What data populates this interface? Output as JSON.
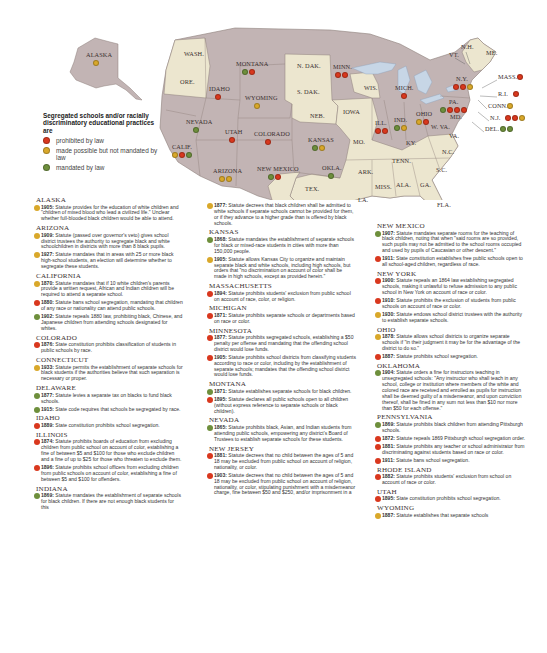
{
  "colors": {
    "prohibited": "#d9381e",
    "made_possible": "#d9a82a",
    "mandated": "#6e8f3c",
    "state_highlight": "#c2b4b4",
    "state_plain": "#ece6cf",
    "water": "#c7d6e6",
    "border": "#8d7f7a"
  },
  "legend": {
    "title": "Segregated schools and/or racially discriminatory educational practices are",
    "items": [
      {
        "key": "prohibited",
        "label": "prohibited by law"
      },
      {
        "key": "made_possible",
        "label": "made possible but not mandated by law"
      },
      {
        "key": "mandated",
        "label": "mandated by law"
      }
    ]
  },
  "map_labels": [
    {
      "name": "ALASKA",
      "x": 86,
      "y": 55,
      "dots": [
        "made_possible"
      ]
    },
    {
      "name": "WASH.",
      "x": 184,
      "y": 54,
      "dots": []
    },
    {
      "name": "ORE.",
      "x": 180,
      "y": 82,
      "dots": []
    },
    {
      "name": "MONTANA",
      "x": 236,
      "y": 64,
      "dots": [
        "mandated",
        "prohibited"
      ]
    },
    {
      "name": "IDAHO",
      "x": 209,
      "y": 89,
      "dots": [
        "prohibited"
      ]
    },
    {
      "name": "WYOMING",
      "x": 245,
      "y": 98,
      "dots": [
        "made_possible"
      ]
    },
    {
      "name": "NEVADA",
      "x": 186,
      "y": 122,
      "dots": [
        "mandated"
      ]
    },
    {
      "name": "UTAH",
      "x": 225,
      "y": 132,
      "dots": [
        "prohibited"
      ]
    },
    {
      "name": "COLORADO",
      "x": 254,
      "y": 134,
      "dots": [
        "prohibited"
      ]
    },
    {
      "name": "CALIF.",
      "x": 172,
      "y": 147,
      "dots": [
        "made_possible",
        "prohibited",
        "mandated"
      ]
    },
    {
      "name": "ARIZONA",
      "x": 213,
      "y": 171,
      "dots": [
        "made_possible",
        "made_possible"
      ]
    },
    {
      "name": "NEW MEXICO",
      "x": 257,
      "y": 169,
      "dots": [
        "mandated",
        "prohibited"
      ]
    },
    {
      "name": "N. DAK.",
      "x": 297,
      "y": 66,
      "dots": []
    },
    {
      "name": "S. DAK.",
      "x": 297,
      "y": 92,
      "dots": []
    },
    {
      "name": "NEB.",
      "x": 310,
      "y": 116,
      "dots": []
    },
    {
      "name": "KANSAS",
      "x": 308,
      "y": 140,
      "dots": [
        "mandated",
        "made_possible"
      ]
    },
    {
      "name": "OKLA.",
      "x": 322,
      "y": 168,
      "dots": [
        "mandated"
      ]
    },
    {
      "name": "TEX.",
      "x": 305,
      "y": 189,
      "dots": []
    },
    {
      "name": "MINN.",
      "x": 333,
      "y": 67,
      "dots": [
        "prohibited",
        "prohibited"
      ]
    },
    {
      "name": "IOWA",
      "x": 343,
      "y": 112,
      "dots": []
    },
    {
      "name": "MO.",
      "x": 353,
      "y": 142,
      "dots": []
    },
    {
      "name": "ARK.",
      "x": 358,
      "y": 172,
      "dots": []
    },
    {
      "name": "WIS.",
      "x": 364,
      "y": 88,
      "dots": []
    },
    {
      "name": "ILL.",
      "x": 375,
      "y": 123,
      "dots": [
        "prohibited",
        "prohibited"
      ]
    },
    {
      "name": "MICH.",
      "x": 395,
      "y": 88,
      "dots": [
        "prohibited"
      ]
    },
    {
      "name": "IND.",
      "x": 394,
      "y": 120,
      "dots": [
        "mandated",
        "made_possible"
      ]
    },
    {
      "name": "OHIO",
      "x": 416,
      "y": 114,
      "dots": [
        "made_possible",
        "prohibited"
      ]
    },
    {
      "name": "KY.",
      "x": 406,
      "y": 143,
      "dots": []
    },
    {
      "name": "TENN.",
      "x": 392,
      "y": 161,
      "dots": []
    },
    {
      "name": "MISS.",
      "x": 375,
      "y": 187,
      "dots": []
    },
    {
      "name": "ALA.",
      "x": 396,
      "y": 185,
      "dots": []
    },
    {
      "name": "GA.",
      "x": 420,
      "y": 185,
      "dots": []
    },
    {
      "name": "LA.",
      "x": 358,
      "y": 200,
      "dots": []
    },
    {
      "name": "FLA.",
      "x": 437,
      "y": 205,
      "dots": []
    },
    {
      "name": "W. VA.",
      "x": 431,
      "y": 127,
      "dots": []
    },
    {
      "name": "VA.",
      "x": 449,
      "y": 136,
      "dots": []
    },
    {
      "name": "N.C.",
      "x": 442,
      "y": 152,
      "dots": []
    },
    {
      "name": "S.C.",
      "x": 436,
      "y": 170,
      "dots": []
    },
    {
      "name": "PA.",
      "x": 449,
      "y": 102,
      "dots": [
        "mandated",
        "prohibited",
        "prohibited",
        "prohibited"
      ]
    },
    {
      "name": "MD.",
      "x": 450,
      "y": 117,
      "dots": []
    },
    {
      "name": "N.Y.",
      "x": 456,
      "y": 79,
      "dots": [
        "prohibited",
        "prohibited",
        "made_possible"
      ]
    },
    {
      "name": "VT.",
      "x": 449,
      "y": 55,
      "dots": []
    },
    {
      "name": "N.H.",
      "x": 461,
      "y": 47,
      "dots": []
    },
    {
      "name": "ME.",
      "x": 486,
      "y": 53,
      "dots": []
    },
    {
      "name": "MASS.",
      "x": 498,
      "y": 77,
      "dots": [
        "prohibited"
      ]
    },
    {
      "name": "R.I.",
      "x": 498,
      "y": 94,
      "dots": [
        "prohibited"
      ]
    },
    {
      "name": "CONN.",
      "x": 488,
      "y": 106,
      "dots": [
        "made_possible"
      ]
    },
    {
      "name": "N.J.",
      "x": 490,
      "y": 118,
      "dots": [
        "prohibited",
        "prohibited",
        "made_possible"
      ]
    },
    {
      "name": "DEL.",
      "x": 485,
      "y": 129,
      "dots": [
        "mandated",
        "mandated"
      ]
    }
  ],
  "columns": [
    [
      {
        "state": "ALASKA",
        "entries": [
          {
            "type": "made_possible",
            "year": "1905:",
            "text": " Statute provides for the education of white children and \"children of mixed blood who lead a civilized life.\" Unclear whether full-blooded black children would be able to attend."
          }
        ]
      },
      {
        "state": "ARIZONA",
        "entries": [
          {
            "type": "made_possible",
            "year": "1909:",
            "text": " Statute (passed over governor's veto) gives school district trustees the authority to segregate black and white schoolchildren in districts with more than 8 black pupils."
          },
          {
            "type": "made_possible",
            "year": "1927:",
            "text": " Statute mandates that in areas with 25 or more black high-school students, an election will determine whether to segregate these students."
          }
        ]
      },
      {
        "state": "CALIFORNIA",
        "entries": [
          {
            "type": "made_possible",
            "year": "1870:",
            "text": " Statute mandates that if 10 white children's parents provide a written request, African and Indian children will be required to attend a separate school."
          },
          {
            "type": "prohibited",
            "year": "1880:",
            "text": " Statute bans school segregation, mandating that children of any race or nationality can attend public schools."
          },
          {
            "type": "mandated",
            "year": "1902:",
            "text": " Statute repeals 1880 law, prohibiting black, Chinese, and Japanese children from attending schools designated for whites."
          }
        ]
      },
      {
        "state": "COLORADO",
        "entries": [
          {
            "type": "prohibited",
            "year": "1876:",
            "text": " State constitution prohibits classification of students in public schools by race."
          }
        ]
      },
      {
        "state": "CONNECTICUT",
        "entries": [
          {
            "type": "made_possible",
            "year": "1933:",
            "text": " Statute permits the establishment of separate schools for black students if the authorities believe that such separation is necessary or proper."
          }
        ]
      },
      {
        "state": "DELAWARE",
        "entries": [
          {
            "type": "mandated",
            "year": "1877:",
            "text": " Statute levies a separate tax on blacks to fund black schools."
          },
          {
            "type": "mandated",
            "year": "1915:",
            "text": " State code requires that schools be segregated by race."
          }
        ]
      },
      {
        "state": "IDAHO",
        "entries": [
          {
            "type": "prohibited",
            "year": "1889:",
            "text": " State constitution prohibits school segregation."
          }
        ]
      },
      {
        "state": "ILLINOIS",
        "entries": [
          {
            "type": "prohibited",
            "year": "1874:",
            "text": " Statute prohibits boards of education from excluding children from public school on account of color, establishing a fine of between $5 and $100 for those who exclude children and a fine of up to $25 for those who threaten to exclude them."
          },
          {
            "type": "prohibited",
            "year": "1896:",
            "text": " Statute prohibits school officers from excluding children from public schools on account of color, establishing a fine of between $5 and $100 for offenders."
          }
        ]
      },
      {
        "state": "INDIANA",
        "entries": [
          {
            "type": "mandated",
            "year": "1869:",
            "text": " Statute mandates the establishment of separate schools for black children. If there are not enough black students for this"
          }
        ]
      }
    ],
    [
      {
        "state": "",
        "entries": [
          {
            "type": "made_possible",
            "year": "1877:",
            "text": " Statute decrees that black children shall be admitted to white schools if separate schools cannot be provided for them, or if they advance to a higher grade than is offered by black schools."
          }
        ]
      },
      {
        "state": "KANSAS",
        "entries": [
          {
            "type": "mandated",
            "year": "1868:",
            "text": " Statute mandates the establishment of separate schools for black or mixed-race students in cities with more than 150,000 people."
          },
          {
            "type": "made_possible",
            "year": "1905:",
            "text": " Statute allows Kansas City to organize and maintain separate black and white schools, including high schools, but orders that \"no discrimination on account of color shall be made in high schools, except as provided herein.\""
          }
        ]
      },
      {
        "state": "MASSACHUSETTS",
        "entries": [
          {
            "type": "prohibited",
            "year": "1894:",
            "text": " Statute prohibits students' exclusion from public school on account of race, color, or religion."
          }
        ]
      },
      {
        "state": "MICHIGAN",
        "entries": [
          {
            "type": "prohibited",
            "year": "1871:",
            "text": " Statute prohibits separate schools or departments based on race or color."
          }
        ]
      },
      {
        "state": "MINNESOTA",
        "entries": [
          {
            "type": "prohibited",
            "year": "1877:",
            "text": " Statute prohibits segregated schools, establishing a $50 penalty per offense and mandating that the offending school district would lose funds."
          },
          {
            "type": "prohibited",
            "year": "1905:",
            "text": " Statute prohibits school districts from classifying students according to race or color, including by the establishment of separate schools; mandates that the offending school district would lose funds."
          }
        ]
      },
      {
        "state": "MONTANA",
        "entries": [
          {
            "type": "mandated",
            "year": "1871:",
            "text": " Statute establishes separate schools for black children."
          },
          {
            "type": "prohibited",
            "year": "1895:",
            "text": " Statute declares all public schools open to all children (without express reference to separate schools or black children)."
          }
        ]
      },
      {
        "state": "NEVADA",
        "entries": [
          {
            "type": "mandated",
            "year": "1865:",
            "text": " Statute prohibits black, Asian, and Indian students from attending public schools, empowering any district's Board of Trustees to establish separate schools for these students."
          }
        ]
      },
      {
        "state": "NEW JERSEY",
        "entries": [
          {
            "type": "prohibited",
            "year": "1881:",
            "text": " Statute decrees that no child between the ages of 5 and 18 may be excluded from public school on account of religion, nationality, or color."
          },
          {
            "type": "prohibited",
            "year": "1903:",
            "text": " Statute decrees that no child between the ages of 5 and 18 may be excluded from public school on account of religion, nationality, or color, stipulating punishment with a misdemeanor charge, fine between $50 and $250, and/or imprisonment in a"
          }
        ]
      }
    ],
    [
      {
        "state": "NEW MEXICO",
        "entries": [
          {
            "type": "mandated",
            "year": "1907:",
            "text": " Statute mandates separate rooms for the teaching of black children, noting that when \"said rooms are so provided, such pupils may not be admitted to the school rooms occupied and used by pupils of Caucasian or other descent.\""
          },
          {
            "type": "prohibited",
            "year": "1911:",
            "text": " State constitution establishes free public schools open to all school-aged children, regardless of race."
          }
        ]
      },
      {
        "state": "NEW YORK",
        "entries": [
          {
            "type": "prohibited",
            "year": "1900:",
            "text": " Statute repeals an 1864 law establishing segregated schools, making it unlawful to refuse admission to any public school in New York on account of race or color."
          },
          {
            "type": "prohibited",
            "year": "1910:",
            "text": " Statute prohibits the exclusion of students from public schools on account of race or color."
          },
          {
            "type": "made_possible",
            "year": "1930:",
            "text": " Statute endows school district trustees with the authority to establish separate schools."
          }
        ]
      },
      {
        "state": "OHIO",
        "entries": [
          {
            "type": "made_possible",
            "year": "1878:",
            "text": " Statute allows school districts to organize separate schools if \"in their judgment it may be for the advantage of the district to do so.\""
          },
          {
            "type": "prohibited",
            "year": "1887:",
            "text": " Statute prohibits school segregation."
          }
        ]
      },
      {
        "state": "OKLAHOMA",
        "entries": [
          {
            "type": "mandated",
            "year": "1904:",
            "text": " Statute orders a fine for instructors teaching in unsegregated schools: \"Any instructor who shall teach in any school, college or institution where members of the white and colored race are received and enrolled as pupils for instruction shall be deemed guilty of a misdemeanor, and upon conviction thereof, shall be fined in any sum not less than $10 nor more than $50 for each offense.\""
          }
        ]
      },
      {
        "state": "PENNSYLVANIA",
        "entries": [
          {
            "type": "mandated",
            "year": "1869:",
            "text": " Statute prohibits black children from attending Pittsburgh schools."
          },
          {
            "type": "prohibited",
            "year": "1872:",
            "text": " Statute repeals 1869 Pittsburgh school segregation order."
          },
          {
            "type": "prohibited",
            "year": "1881:",
            "text": " Statute prohibits any teacher or school administrator from discriminating against students based on race or color."
          },
          {
            "type": "prohibited",
            "year": "1911:",
            "text": " Statute bans school segregation."
          }
        ]
      },
      {
        "state": "RHODE ISLAND",
        "entries": [
          {
            "type": "prohibited",
            "year": "1882:",
            "text": " Statute prohibits students' exclusion from school on account of race or color."
          }
        ]
      },
      {
        "state": "UTAH",
        "entries": [
          {
            "type": "prohibited",
            "year": "1895:",
            "text": " State constitution prohibits school segregation."
          }
        ]
      },
      {
        "state": "WYOMING",
        "entries": [
          {
            "type": "made_possible",
            "year": "1887:",
            "text": " Statute establishes that separate schools"
          }
        ]
      }
    ]
  ]
}
